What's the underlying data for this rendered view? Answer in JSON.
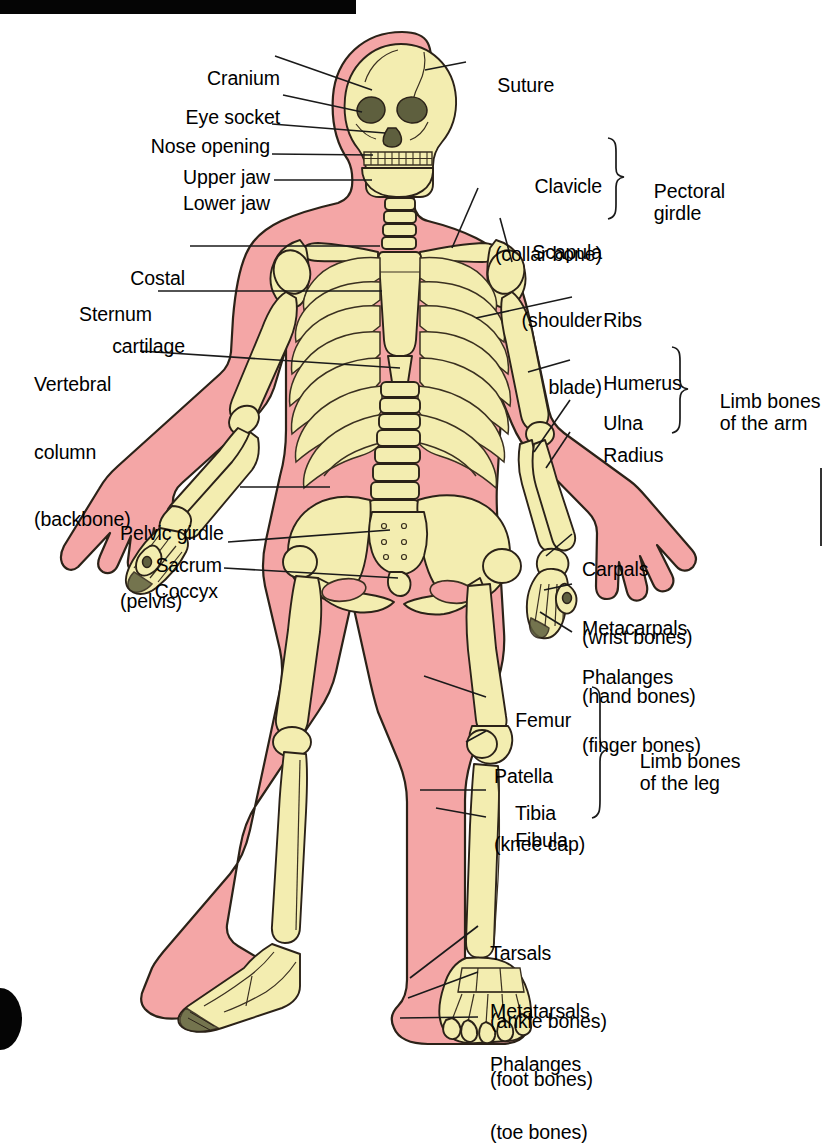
{
  "diagram": {
    "colors": {
      "body_pink": "#F4A6A6",
      "body_pink_shadow": "#E98F8F",
      "bone_cream": "#F3EDB0",
      "bone_shade": "#E4DA93",
      "outline": "#2B2218",
      "eye_socket": "#5E5F3E",
      "background": "#FFFFFF",
      "bar_black": "#050505"
    }
  },
  "labels_left": [
    {
      "id": "cranium",
      "line1": "Cranium",
      "line2": ""
    },
    {
      "id": "eye-socket",
      "line1": "Eye socket",
      "line2": ""
    },
    {
      "id": "nose-opening",
      "line1": "Nose opening",
      "line2": ""
    },
    {
      "id": "upper-jaw",
      "line1": "Upper jaw",
      "line2": ""
    },
    {
      "id": "lower-jaw",
      "line1": "Lower jaw",
      "line2": ""
    },
    {
      "id": "costal-cartilage",
      "line1": "Costal",
      "line2": "cartilage"
    },
    {
      "id": "sternum",
      "line1": "Sternum",
      "line2": ""
    },
    {
      "id": "vertebral-column",
      "line1": "Vertebral",
      "line2": "column",
      "line3": "(backbone)"
    },
    {
      "id": "pelvic-girdle",
      "line1": "Pelvic girdle",
      "line2": "(pelvis)"
    },
    {
      "id": "sacrum",
      "line1": "Sacrum",
      "line2": ""
    },
    {
      "id": "coccyx",
      "line1": "Coccyx",
      "line2": ""
    }
  ],
  "labels_right": [
    {
      "id": "suture",
      "line1": "Suture",
      "line2": ""
    },
    {
      "id": "clavicle",
      "line1": "Clavicle",
      "line2": "(collar bone)"
    },
    {
      "id": "scapula",
      "line1": "Scapula",
      "line2": "(shoulder",
      "line3": "blade)"
    },
    {
      "id": "ribs",
      "line1": "Ribs",
      "line2": ""
    },
    {
      "id": "humerus",
      "line1": "Humerus",
      "line2": ""
    },
    {
      "id": "ulna",
      "line1": "Ulna",
      "line2": ""
    },
    {
      "id": "radius",
      "line1": "Radius",
      "line2": ""
    },
    {
      "id": "carpals",
      "line1": "Carpals",
      "line2": "(wrist bones)"
    },
    {
      "id": "metacarpals",
      "line1": "Metacarpals",
      "line2": "(hand bones)"
    },
    {
      "id": "phalanges-hand",
      "line1": "Phalanges",
      "line2": "(finger bones)"
    },
    {
      "id": "femur",
      "line1": "Femur",
      "line2": ""
    },
    {
      "id": "patella",
      "line1": "Patella",
      "line2": "(knee cap)"
    },
    {
      "id": "tibia",
      "line1": "Tibia",
      "line2": ""
    },
    {
      "id": "fibula",
      "line1": "Fibula",
      "line2": ""
    },
    {
      "id": "tarsals",
      "line1": "Tarsals",
      "line2": "(ankle bones)"
    },
    {
      "id": "metatarsals",
      "line1": "Metatarsals",
      "line2": "(foot bones)"
    },
    {
      "id": "phalanges-foot",
      "line1": "Phalanges",
      "line2": "(toe bones)"
    }
  ],
  "group_labels": [
    {
      "id": "pectoral-girdle",
      "line1": "Pectoral",
      "line2": "girdle"
    },
    {
      "id": "limb-bones-arm",
      "line1": "Limb bones",
      "line2": "of the arm"
    },
    {
      "id": "limb-bones-leg",
      "line1": "Limb bones",
      "line2": "of the leg"
    }
  ]
}
